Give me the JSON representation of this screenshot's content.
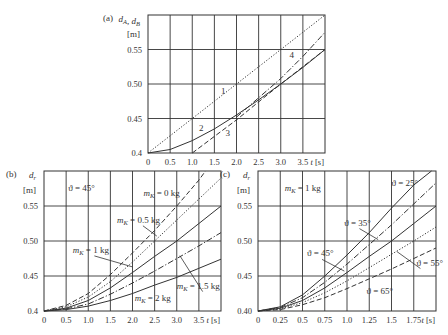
{
  "chart_data": [
    {
      "type": "line",
      "panel_label": "(a)",
      "ylabel": "d_A, d_B",
      "yunit": "[m]",
      "xlabel": "t [s]",
      "xlim": [
        0,
        4.0
      ],
      "ylim": [
        0.4,
        0.6
      ],
      "xticks": [
        0,
        0.5,
        1.0,
        1.5,
        2.0,
        2.5,
        3.0,
        3.5
      ],
      "xtick_labels": [
        "0",
        "0.5",
        "1.0",
        "1.5",
        "2.0",
        "2.5",
        "3.0",
        "3.5"
      ],
      "yticks": [
        0.4,
        0.45,
        0.5,
        0.55
      ],
      "ytick_labels": [
        "0.4",
        "0.45",
        "0.50",
        "0.55"
      ],
      "grid": true,
      "frame": {
        "x": 148,
        "y": 15,
        "w": 177,
        "h": 138
      },
      "series": [
        {
          "name": "1",
          "style": "dotted",
          "x": [
            0,
            1,
            2,
            3,
            4
          ],
          "y": [
            0.4,
            0.45,
            0.5,
            0.55,
            0.6
          ],
          "label_pos": [
            1.65,
            0.485
          ]
        },
        {
          "name": "2",
          "style": "solid",
          "x": [
            0,
            0.5,
            1.0,
            1.5,
            2.0,
            2.5,
            3.0,
            3.5,
            4.0
          ],
          "y": [
            0.4,
            0.405,
            0.418,
            0.435,
            0.455,
            0.477,
            0.5,
            0.524,
            0.55
          ],
          "label_pos": [
            1.15,
            0.432
          ]
        },
        {
          "name": "3",
          "style": "dashed",
          "x": [
            1.0,
            1.5,
            2.0,
            2.5,
            3.0,
            3.5,
            4.0
          ],
          "y": [
            0.4,
            0.424,
            0.448,
            0.474,
            0.5,
            0.525,
            0.55
          ],
          "label_pos": [
            1.75,
            0.425
          ]
        },
        {
          "name": "4",
          "style": "dashdot",
          "x": [
            2.0,
            2.5,
            3.0,
            3.5,
            4.0
          ],
          "y": [
            0.452,
            0.48,
            0.508,
            0.54,
            0.575
          ],
          "label_pos": [
            3.2,
            0.537
          ]
        }
      ]
    },
    {
      "type": "line",
      "panel_label": "(b)",
      "ylabel": "d_r",
      "yunit": "[m]",
      "xlabel": "t [s]",
      "xlim": [
        0,
        4.0
      ],
      "ylim": [
        0.4,
        0.6
      ],
      "xticks": [
        0,
        0.5,
        1.0,
        1.5,
        2.0,
        2.5,
        3.0,
        3.5
      ],
      "xtick_labels": [
        "0",
        "0.5",
        "1.0",
        "1.5",
        "2.0",
        "2.5",
        "3.0",
        "3.5"
      ],
      "yticks": [
        0.4,
        0.45,
        0.5,
        0.55
      ],
      "ytick_labels": [
        "0.4",
        "0.45",
        "0.50",
        "0.55"
      ],
      "grid": true,
      "frame": {
        "x": 44,
        "y": 171,
        "w": 177,
        "h": 140
      },
      "annotation": "ϑ = 45°",
      "series": [
        {
          "name": "m_K = 0 kg",
          "style": "dashed",
          "x": [
            0,
            0.5,
            1.0,
            1.5,
            2.0,
            2.5,
            3.0,
            3.5,
            3.65
          ],
          "y": [
            0.4,
            0.408,
            0.425,
            0.452,
            0.483,
            0.515,
            0.55,
            0.587,
            0.6
          ]
        },
        {
          "name": "m_K = 0.5 kg",
          "style": "dotted",
          "x": [
            0,
            0.5,
            1.0,
            1.5,
            2.0,
            2.5,
            3.0,
            3.5,
            4.0
          ],
          "y": [
            0.4,
            0.406,
            0.42,
            0.442,
            0.47,
            0.5,
            0.53,
            0.56,
            0.59
          ]
        },
        {
          "name": "m_K = 1 kg",
          "style": "solid",
          "x": [
            0,
            0.5,
            1.0,
            1.5,
            2.0,
            2.5,
            3.0,
            3.5,
            4.0
          ],
          "y": [
            0.4,
            0.404,
            0.415,
            0.433,
            0.455,
            0.478,
            0.5,
            0.525,
            0.55
          ]
        },
        {
          "name": "m_K = 1.5 kg",
          "style": "dashdot",
          "x": [
            0,
            0.5,
            1.0,
            1.5,
            2.0,
            2.5,
            3.0,
            3.5,
            4.0
          ],
          "y": [
            0.4,
            0.403,
            0.41,
            0.424,
            0.44,
            0.457,
            0.475,
            0.493,
            0.512
          ]
        },
        {
          "name": "m_K = 2 kg",
          "style": "solid",
          "x": [
            0,
            0.5,
            1.0,
            1.5,
            2.0,
            2.5,
            3.0,
            3.5,
            4.0
          ],
          "y": [
            0.4,
            0.402,
            0.407,
            0.415,
            0.425,
            0.437,
            0.448,
            0.461,
            0.474
          ]
        }
      ],
      "labels": [
        {
          "text": "m_K = 0 kg",
          "pos": [
            2.25,
            0.565
          ]
        },
        {
          "text": "m_K = 0.5 kg",
          "pos": [
            1.65,
            0.526
          ],
          "leader_to": [
            2.55,
            0.507
          ]
        },
        {
          "text": "m_K = 1 kg",
          "pos": [
            0.65,
            0.483
          ],
          "leader_to": [
            2.0,
            0.463
          ]
        },
        {
          "text": "m_K = 1.5 kg",
          "pos": [
            3.0,
            0.432
          ],
          "leader_to": [
            3.07,
            0.479
          ]
        },
        {
          "text": "m_K = 2 kg",
          "pos": [
            2.05,
            0.415
          ]
        }
      ]
    },
    {
      "type": "line",
      "panel_label": "(c)",
      "ylabel": "d_r",
      "yunit": "[m]",
      "xlabel": "t [s]",
      "xlim": [
        0,
        2.0
      ],
      "ylim": [
        0.4,
        0.6
      ],
      "xticks": [
        0,
        0.25,
        0.5,
        0.75,
        1.0,
        1.25,
        1.5,
        1.75
      ],
      "xtick_labels": [
        "0",
        "0.25",
        "0.5",
        "0.75",
        "1.0",
        "1.25",
        "1.5",
        "1.75"
      ],
      "yticks": [
        0.4,
        0.45,
        0.5,
        0.55
      ],
      "ytick_labels": [
        "0.40",
        "0.45",
        "0.50",
        "0.55"
      ],
      "grid": true,
      "frame": {
        "x": 258,
        "y": 171,
        "w": 178,
        "h": 140
      },
      "annotation": "m_K = 1 kg",
      "series": [
        {
          "name": "ϑ = 25°",
          "style": "solid",
          "x": [
            0,
            0.25,
            0.5,
            0.75,
            1.0,
            1.25,
            1.5,
            1.75,
            1.95
          ],
          "y": [
            0.4,
            0.406,
            0.423,
            0.45,
            0.48,
            0.512,
            0.547,
            0.58,
            0.6
          ]
        },
        {
          "name": "ϑ = 35°",
          "style": "dashdot",
          "x": [
            0,
            0.25,
            0.5,
            0.75,
            1.0,
            1.25,
            1.5,
            1.75,
            2.0
          ],
          "y": [
            0.4,
            0.405,
            0.419,
            0.441,
            0.467,
            0.495,
            0.523,
            0.553,
            0.583
          ]
        },
        {
          "name": "ϑ = 45°",
          "style": "solid",
          "x": [
            0,
            0.25,
            0.5,
            0.75,
            1.0,
            1.25,
            1.5,
            1.75,
            2.0
          ],
          "y": [
            0.4,
            0.404,
            0.415,
            0.433,
            0.455,
            0.478,
            0.5,
            0.525,
            0.55
          ]
        },
        {
          "name": "ϑ = 55°",
          "style": "dotted",
          "x": [
            0,
            0.25,
            0.5,
            0.75,
            1.0,
            1.25,
            1.5,
            1.75,
            2.0
          ],
          "y": [
            0.4,
            0.403,
            0.412,
            0.426,
            0.443,
            0.462,
            0.481,
            0.5,
            0.52
          ]
        },
        {
          "name": "ϑ = 65°",
          "style": "dashed",
          "x": [
            0,
            0.25,
            0.5,
            0.75,
            1.0,
            1.25,
            1.5,
            1.75,
            2.0
          ],
          "y": [
            0.4,
            0.402,
            0.409,
            0.419,
            0.432,
            0.446,
            0.46,
            0.475,
            0.49
          ]
        }
      ],
      "labels": [
        {
          "text": "ϑ = 25°",
          "pos": [
            1.5,
            0.578
          ]
        },
        {
          "text": "ϑ = 35°",
          "pos": [
            0.97,
            0.522
          ],
          "leader_to": [
            1.35,
            0.502
          ]
        },
        {
          "text": "ϑ = 45°",
          "pos": [
            0.55,
            0.478
          ],
          "leader_to": [
            0.97,
            0.457
          ]
        },
        {
          "text": "ϑ = 55°",
          "pos": [
            1.78,
            0.465
          ],
          "leader_to": [
            1.56,
            0.485
          ]
        },
        {
          "text": "ϑ = 65°",
          "pos": [
            1.22,
            0.425
          ]
        }
      ]
    }
  ]
}
